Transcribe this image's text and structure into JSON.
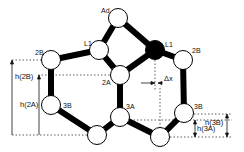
{
  "diagram": {
    "type": "molecular-structure-schematic",
    "colors": {
      "bond": "#000000",
      "node_fill": "#ffffff",
      "node_stroke": "#000000",
      "dark_node_fill": "#000000",
      "guide": "#333333"
    },
    "nodes": [
      {
        "id": "ad",
        "label": "Ad",
        "x": 118,
        "y": 18,
        "dark": false
      },
      {
        "id": "l1-left",
        "label": "L1",
        "x": 99,
        "y": 50,
        "dark": false
      },
      {
        "id": "l1-right",
        "label": "L1",
        "x": 155,
        "y": 50,
        "dark": true
      },
      {
        "id": "2b-left",
        "label": "2B",
        "x": 51,
        "y": 60,
        "dark": false
      },
      {
        "id": "2b-right",
        "label": "2B",
        "x": 183,
        "y": 60,
        "dark": false
      },
      {
        "id": "2a",
        "label": "2A",
        "x": 120,
        "y": 75,
        "dark": false
      },
      {
        "id": "3b-left",
        "label": "3B",
        "x": 51,
        "y": 105,
        "dark": false
      },
      {
        "id": "3a",
        "label": "3A",
        "x": 120,
        "y": 117,
        "dark": false
      },
      {
        "id": "bottom-left",
        "label": "",
        "x": 97,
        "y": 135,
        "dark": false
      },
      {
        "id": "bottom-right",
        "label": "",
        "x": 160,
        "y": 137,
        "dark": false
      },
      {
        "id": "3b-right",
        "label": "3B",
        "x": 184,
        "y": 113,
        "dark": false
      }
    ],
    "edges": [
      [
        "ad",
        "l1-left"
      ],
      [
        "ad",
        "l1-right"
      ],
      [
        "l1-left",
        "2b-left"
      ],
      [
        "l1-left",
        "2a"
      ],
      [
        "l1-right",
        "2a"
      ],
      [
        "l1-right",
        "2b-right"
      ],
      [
        "2b-left",
        "3b-left"
      ],
      [
        "2a",
        "3a"
      ],
      [
        "3b-left",
        "bottom-left"
      ],
      [
        "bottom-left",
        "3a"
      ],
      [
        "3a",
        "bottom-right"
      ],
      [
        "bottom-right",
        "3b-right"
      ],
      [
        "3b-right",
        "2b-right"
      ]
    ],
    "labels": {
      "ad": "Ad",
      "l1_left": "L1",
      "l1_right": "L1",
      "b2_left": "2B",
      "b2_right": "2B",
      "a2": "2A",
      "b3_left": "3B",
      "a3": "3A",
      "b3_right": "3B",
      "h2b": "h(2B)",
      "h2a": "h(2A)",
      "h3b": "h(3B)",
      "h3a": "h(3A)",
      "dx": "Δx"
    }
  }
}
